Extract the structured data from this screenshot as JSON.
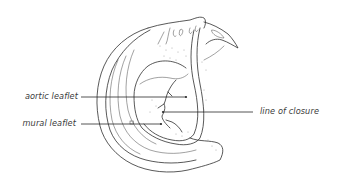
{
  "figure": {
    "labels": [
      {
        "id": "aortic",
        "text": "aortic leaflet",
        "side": "left"
      },
      {
        "id": "mural",
        "text": "mural leaflet",
        "side": "left"
      },
      {
        "id": "closure",
        "text": "line of closure",
        "side": "right"
      }
    ],
    "colors": {
      "ink": "#2e2e2e",
      "background": "#ffffff"
    }
  }
}
